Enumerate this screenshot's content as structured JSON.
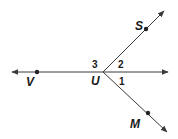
{
  "diagram": {
    "type": "rays-angles",
    "vertex": {
      "label": "U",
      "x": 103,
      "y": 72
    },
    "points": [
      {
        "label": "V",
        "x": 37,
        "y": 72
      },
      {
        "label": "S",
        "x": 146,
        "y": 29
      },
      {
        "label": "M",
        "x": 148,
        "y": 113
      }
    ],
    "angle_labels": [
      "1",
      "2",
      "3"
    ],
    "line_color": "#3a3a3a"
  }
}
